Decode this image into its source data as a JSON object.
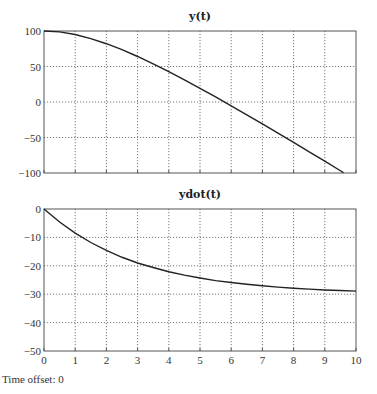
{
  "footer": {
    "time_offset_label": "Time offset: 0"
  },
  "chart_data": [
    {
      "type": "line",
      "title": "y(t)",
      "xlabel": "",
      "ylabel": "",
      "xlim": [
        0,
        10
      ],
      "ylim": [
        -100,
        100
      ],
      "x_ticks": [
        0,
        1,
        2,
        3,
        4,
        5,
        6,
        7,
        8,
        9,
        10
      ],
      "y_ticks": [
        -100,
        -50,
        0,
        50,
        100
      ],
      "grid": true,
      "show_x_tick_labels": false,
      "series": [
        {
          "name": "y(t)",
          "x": [
            0,
            0.5,
            1,
            1.5,
            2,
            2.5,
            3,
            3.5,
            4,
            4.5,
            5,
            5.5,
            6,
            6.5,
            7,
            7.5,
            8,
            8.5,
            9,
            9.5,
            9.6
          ],
          "values": [
            100,
            98.7,
            95.0,
            89.3,
            82.1,
            73.7,
            64.1,
            53.7,
            42.7,
            31.2,
            19.3,
            7.1,
            -5.4,
            -18.1,
            -30.9,
            -43.9,
            -57.0,
            -70.2,
            -83.4,
            -96.8,
            -99.5
          ]
        }
      ]
    },
    {
      "type": "line",
      "title": "ydot(t)",
      "xlabel": "",
      "ylabel": "",
      "xlim": [
        0,
        10
      ],
      "ylim": [
        -50,
        0
      ],
      "x_ticks": [
        0,
        1,
        2,
        3,
        4,
        5,
        6,
        7,
        8,
        9,
        10
      ],
      "y_ticks": [
        -50,
        -40,
        -30,
        -20,
        -10,
        0
      ],
      "grid": true,
      "show_x_tick_labels": true,
      "series": [
        {
          "name": "ydot(t)",
          "x": [
            0,
            0.5,
            1,
            1.5,
            2,
            2.5,
            3,
            3.5,
            4,
            4.5,
            5,
            5.5,
            6,
            6.5,
            7,
            7.5,
            8,
            8.5,
            9,
            9.5,
            10
          ],
          "values": [
            0,
            -4.6,
            -8.5,
            -11.8,
            -14.6,
            -17.0,
            -19.0,
            -20.6,
            -22.1,
            -23.3,
            -24.3,
            -25.2,
            -25.9,
            -26.5,
            -27.0,
            -27.5,
            -27.9,
            -28.2,
            -28.5,
            -28.7,
            -28.9
          ]
        }
      ]
    }
  ]
}
